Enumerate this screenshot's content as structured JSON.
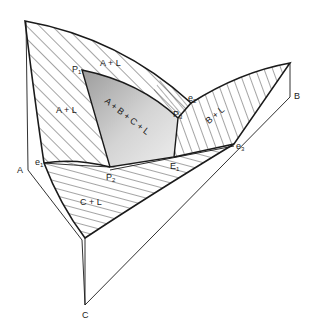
{
  "diagram": {
    "type": "ternary-liquidus-projection",
    "components": {
      "a": "A",
      "b": "B",
      "c": "C"
    },
    "fields": {
      "a_plus_l_upper": "A + L",
      "a_plus_l_left": "A + L",
      "b_plus_l": "B + L",
      "c_plus_l": "C + L",
      "four_phase": "A + B + C + L"
    },
    "points": {
      "p1": {
        "label": "P",
        "sub": "1"
      },
      "p2": {
        "label": "P",
        "sub": "2"
      },
      "p3": {
        "label": "P",
        "sub": "3"
      },
      "e1": {
        "label": "e",
        "sub": "1"
      },
      "e2": {
        "label": "e",
        "sub": "2"
      },
      "e3": {
        "label": "e",
        "sub": "3"
      },
      "E1": {
        "label": "E",
        "sub": "1"
      }
    },
    "colors": {
      "line": "#1a1a1a",
      "shade_light": "#e6e6e6",
      "shade_dark": "#a8a8a8"
    }
  }
}
